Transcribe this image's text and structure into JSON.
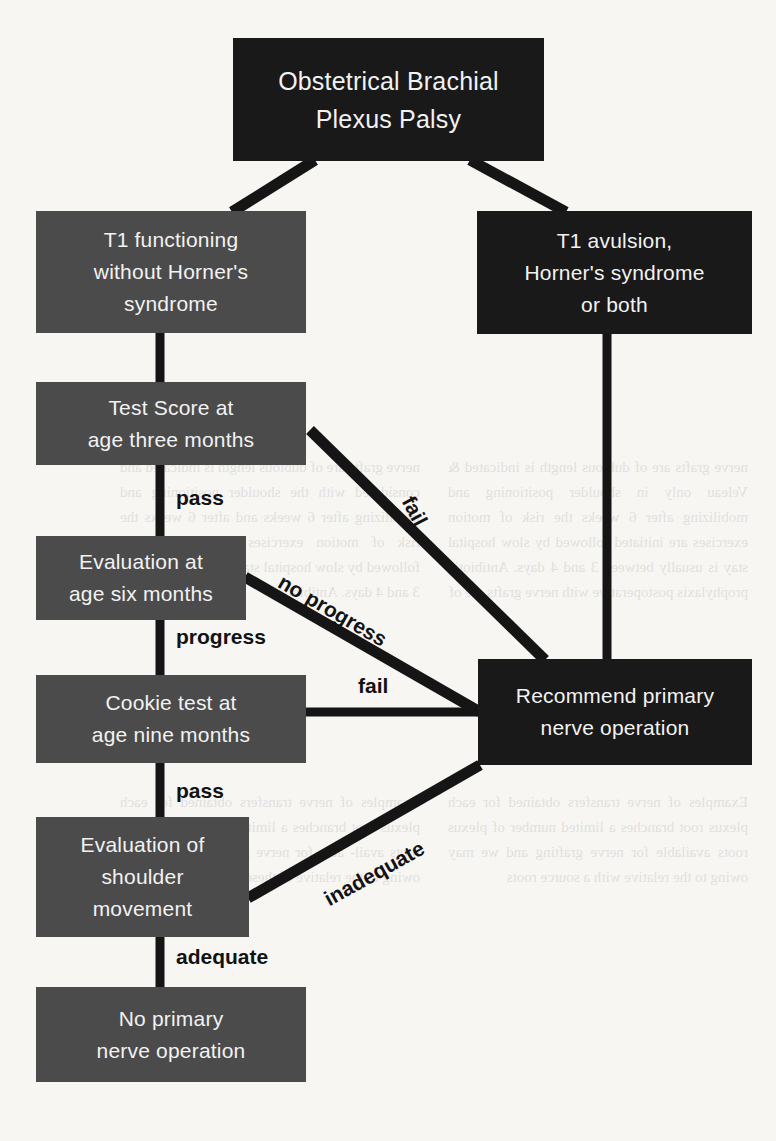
{
  "diagram": {
    "type": "flowchart",
    "colors": {
      "page_background": "#f7f6f3",
      "node_dark": "#191919",
      "node_mid": "#4b4b4b",
      "node_text": "#f2f2f2",
      "edge_line": "#151515",
      "edge_label_text": "#121212"
    },
    "nodes": [
      {
        "id": "root",
        "style": "dark",
        "lines": [
          "Obstetrical Brachial",
          "Plexus Palsy"
        ],
        "font_size": 25
      },
      {
        "id": "t1-functioning",
        "style": "mid",
        "lines": [
          "T1 functioning",
          "without Horner's",
          "syndrome"
        ],
        "font_size": 21
      },
      {
        "id": "t1-avulsion",
        "style": "dark",
        "lines": [
          "T1 avulsion,",
          "Horner's syndrome",
          "or both"
        ],
        "font_size": 21
      },
      {
        "id": "test-score-three-months",
        "style": "mid",
        "lines": [
          "Test Score at",
          "age three months"
        ],
        "font_size": 21
      },
      {
        "id": "evaluation-six-months",
        "style": "mid",
        "lines": [
          "Evaluation at",
          "age six months"
        ],
        "font_size": 21
      },
      {
        "id": "cookie-test-nine-months",
        "style": "mid",
        "lines": [
          "Cookie test at",
          "age nine months"
        ],
        "font_size": 21
      },
      {
        "id": "evaluation-shoulder-movement",
        "style": "mid",
        "lines": [
          "Evaluation of",
          "shoulder",
          "movement"
        ],
        "font_size": 21
      },
      {
        "id": "no-primary-nerve-operation",
        "style": "mid",
        "lines": [
          "No primary",
          "nerve operation"
        ],
        "font_size": 21
      },
      {
        "id": "recommend-primary-nerve-operation",
        "style": "dark",
        "lines": [
          "Recommend primary",
          "nerve operation"
        ],
        "font_size": 21
      }
    ],
    "edge_labels": [
      {
        "id": "pass-three-months",
        "text": "pass",
        "from": "test-score-three-months",
        "to": "evaluation-six-months"
      },
      {
        "id": "fail-three-months",
        "text": "fail",
        "from": "test-score-three-months",
        "to": "recommend-primary-nerve-operation"
      },
      {
        "id": "progress-six-months",
        "text": "progress",
        "from": "evaluation-six-months",
        "to": "cookie-test-nine-months"
      },
      {
        "id": "no-progress",
        "text": "no progress",
        "from": "evaluation-six-months",
        "to": "recommend-primary-nerve-operation"
      },
      {
        "id": "pass-nine-months",
        "text": "pass",
        "from": "cookie-test-nine-months",
        "to": "evaluation-shoulder-movement"
      },
      {
        "id": "fail-nine-months",
        "text": "fail",
        "from": "cookie-test-nine-months",
        "to": "recommend-primary-nerve-operation"
      },
      {
        "id": "adequate",
        "text": "adequate",
        "from": "evaluation-shoulder-movement",
        "to": "no-primary-nerve-operation"
      },
      {
        "id": "inadequate",
        "text": "inadequate",
        "from": "evaluation-shoulder-movement",
        "to": "recommend-primary-nerve-operation"
      }
    ]
  },
  "background_text": {
    "col_a": "nerve grafts are of dubious length is indicated &  Veleau only in shoulder positioning and mobilizing after 6 weeks the risk of motion exercises are initiated followed by slow hospital stay is usually between 3 and 4 days. Antibiotic prophylaxis postoperative with nerve grafts are of",
    "col_b": "nerve grafts are of dubious length is indicated and considered with the shoulder positioning and mobilizing after 6 weeks and after 6 weeks the risk of motion exercises are initiated and followed by slow hospital stay is usually between 3 and 4 days. Antibiotic",
    "col_c": "Examples of nerve transfers obtained for each plexus root branches a limited number of plexus roots available for nerve grafting and we may owing to the relative with a source roots",
    "col_d": "Examples of nerve transfers obtained for each plexus root branches a limited number of plexus roots avail- able for nerve grafting and we may owing to the relative of these roots as a source"
  }
}
